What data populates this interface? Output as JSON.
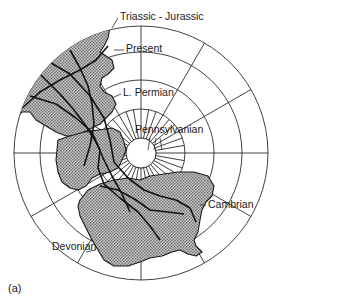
{
  "figure": {
    "panel_label": "(a)",
    "labels": {
      "triassic_jurassic": "Triassic - Jurassic",
      "present": "Present",
      "l_permian": "L. Permian",
      "pennsylvanian": "Pennsylvanian",
      "cambrian": "Cambrian",
      "devonian": "Devonian"
    },
    "colors": {
      "line": "#2b2b2b",
      "land_fill": "#9a9a9a",
      "background": "#ffffff"
    },
    "grid": {
      "center": [
        141,
        153
      ],
      "ring_radii": [
        15,
        44,
        73,
        101,
        127
      ],
      "meridian_step_deg": 30,
      "short_spoke_step_deg": 10
    }
  }
}
